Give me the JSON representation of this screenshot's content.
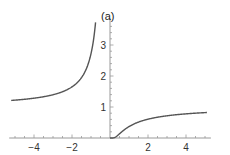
{
  "chart_data": {
    "type": "line",
    "title": "(a)",
    "xlabel": "",
    "ylabel": "",
    "function": "exp(-1/x)",
    "xlim": [
      -5.2,
      5.1
    ],
    "ylim": [
      0,
      3.8
    ],
    "grid": false,
    "legend": null,
    "x_ticks": [
      -4,
      -2,
      2,
      4
    ],
    "x_tick_labels": [
      "-4",
      "-2",
      "2",
      "4"
    ],
    "y_ticks": [
      1,
      2,
      3
    ],
    "y_tick_labels": [
      "1",
      "2",
      "3"
    ],
    "series": [
      {
        "name": "left branch",
        "x": [
          -5.2,
          -5,
          -4,
          -3,
          -2.5,
          -2,
          -1.5,
          -1.25,
          -1,
          -0.9,
          -0.8,
          -0.76
        ],
        "y": [
          1.21,
          1.22,
          1.28,
          1.4,
          1.49,
          1.65,
          1.95,
          2.23,
          2.72,
          3.04,
          3.49,
          3.72
        ]
      },
      {
        "name": "right branch",
        "x": [
          0,
          0.1,
          0.25,
          0.5,
          0.75,
          1,
          1.5,
          2,
          3,
          4,
          5,
          5.1
        ],
        "y": [
          0,
          5e-05,
          0.018,
          0.135,
          0.264,
          0.368,
          0.513,
          0.607,
          0.717,
          0.779,
          0.819,
          0.822
        ]
      }
    ],
    "colors": {
      "curve": "#555555",
      "axis": "#999999",
      "text": "#333333"
    }
  }
}
